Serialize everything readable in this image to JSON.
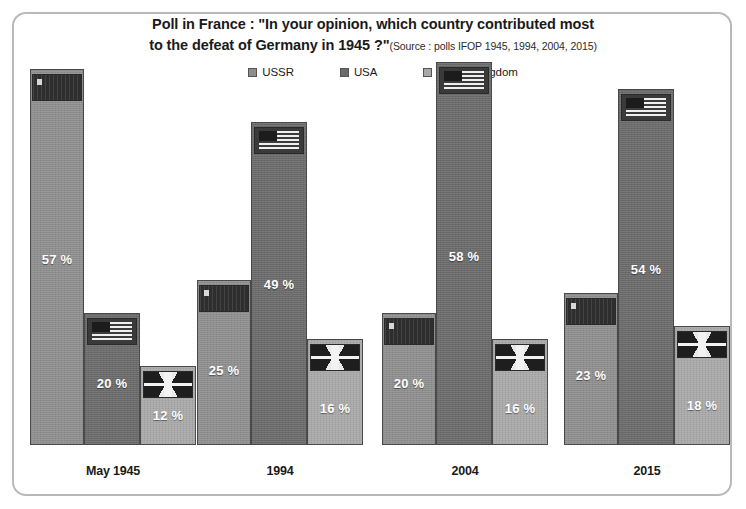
{
  "chart_data": {
    "type": "bar",
    "title_line1": "Poll in France : \"In your opinion, which country contributed most",
    "title_line2": "to the defeat of Germany in 1945 ?\"",
    "source": "(Source : polls IFOP 1945, 1994, 2004, 2015)",
    "categories": [
      "May 1945",
      "1994",
      "2004",
      "2015"
    ],
    "series": [
      {
        "name": "USSR",
        "color": "#8e8e8e",
        "values": [
          57,
          25,
          20,
          23
        ],
        "labels": [
          "57 %",
          "25 %",
          "20 %",
          "23 %"
        ],
        "flag": "ussr-flag-icon"
      },
      {
        "name": "USA",
        "color": "#6a6a6a",
        "values": [
          20,
          49,
          58,
          54
        ],
        "labels": [
          "20 %",
          "49 %",
          "58 %",
          "54 %"
        ],
        "flag": "usa-flag-icon"
      },
      {
        "name": "United Kingdom",
        "color": "#a8a8a8",
        "values": [
          12,
          16,
          16,
          18
        ],
        "labels": [
          "12 %",
          "16 %",
          "16 %",
          "18 %"
        ],
        "flag": "uk-flag-icon"
      }
    ],
    "xlabel": "",
    "ylabel": "",
    "ylim": [
      0,
      60
    ],
    "grid": false,
    "legend_position": "top-center",
    "value_unit": "%"
  },
  "legend": {
    "items": [
      {
        "label": "USSR",
        "color": "#8e8e8e"
      },
      {
        "label": "USA",
        "color": "#6a6a6a"
      },
      {
        "label": "United Kingdom",
        "color": "#a8a8a8"
      }
    ]
  }
}
